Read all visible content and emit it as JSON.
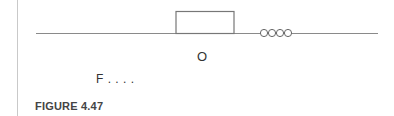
{
  "figure": {
    "caption": "FIGURE 4.47",
    "labels": {
      "center_label": "O",
      "force_label": "F . . . ."
    },
    "elements": {
      "baseline": {
        "x1": 36,
        "x2": 378,
        "y": 33
      },
      "block": {
        "x": 176,
        "y": 11,
        "width": 58,
        "height": 22
      },
      "spring_coils": 4
    }
  }
}
